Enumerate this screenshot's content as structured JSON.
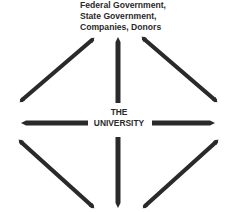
{
  "diagram": {
    "top_label": {
      "lines": [
        "Federal Government,",
        "State Government,",
        "Companies, Donors"
      ]
    },
    "center_label": {
      "lines": [
        "THE",
        "UNIVERSITY"
      ]
    },
    "arrows": [
      {
        "name": "arrow-up",
        "direction": "up"
      },
      {
        "name": "arrow-up-left",
        "direction": "up-left"
      },
      {
        "name": "arrow-up-right",
        "direction": "up-right"
      },
      {
        "name": "arrow-left",
        "direction": "left"
      },
      {
        "name": "arrow-right",
        "direction": "right"
      },
      {
        "name": "arrow-down",
        "direction": "down"
      },
      {
        "name": "arrow-down-left",
        "direction": "down-left"
      },
      {
        "name": "arrow-down-right",
        "direction": "down-right"
      }
    ],
    "colors": {
      "stroke": "#2a2a2a",
      "background": "#ffffff"
    }
  }
}
